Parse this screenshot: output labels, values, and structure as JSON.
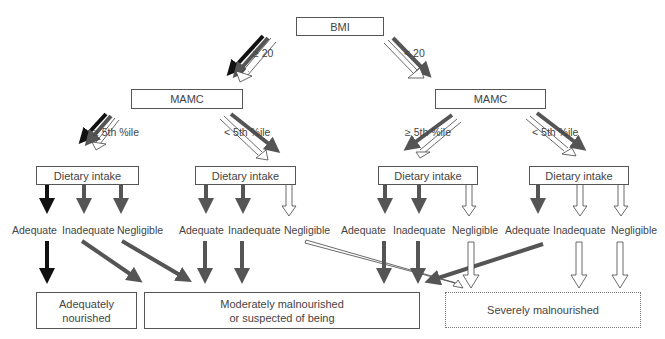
{
  "diagram": {
    "root": {
      "label": "BMI"
    },
    "bmi_branches": [
      {
        "condition": "≥ 20"
      },
      {
        "condition": "< 20"
      }
    ],
    "mamc_nodes": [
      {
        "label": "MAMC"
      },
      {
        "label": "MAMC"
      }
    ],
    "mamc_branches": [
      {
        "condition": "≥ 5th %ile"
      },
      {
        "condition": "< 5th %ile"
      },
      {
        "condition": "≥ 5th %ile"
      },
      {
        "condition": "< 5th %ile"
      }
    ],
    "intake_nodes": [
      {
        "label": "Dietary intake"
      },
      {
        "label": "Dietary intake"
      },
      {
        "label": "Dietary intake"
      },
      {
        "label": "Dietary intake"
      }
    ],
    "intake_levels": [
      "Adequate",
      "Inadequate",
      "Negligible",
      "Adequate",
      "Inadequate",
      "Negligible",
      "Adequate",
      "Inadequate",
      "Negligible",
      "Adequate",
      "Inadequate",
      "Negligible"
    ],
    "outcomes": [
      {
        "label_line1": "Adequately",
        "label_line2": "nourished",
        "arrow_style": "black"
      },
      {
        "label_line1": "Moderately malnourished",
        "label_line2": "or suspected of being",
        "arrow_style": "dark-gray"
      },
      {
        "label_line1": "Severely malnourished",
        "label_line2": "",
        "arrow_style": "white-outline"
      }
    ],
    "colors": {
      "black": "#111111",
      "gray": "#555555",
      "white": "#ffffff",
      "border": "#555555"
    }
  }
}
